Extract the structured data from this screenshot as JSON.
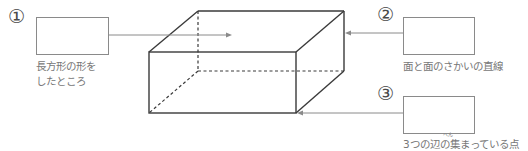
{
  "diagram": {
    "colors": {
      "edge": "#3a3a3a",
      "leader": "#8a8a8a",
      "label_text": "#777777",
      "number": "#4a4a4a"
    },
    "items": [
      {
        "number": "①",
        "label_line1": "長方形の形を",
        "label_line2": "したところ",
        "points_to": "face"
      },
      {
        "number": "②",
        "label": "面と面のさかいの直線",
        "points_to": "edge"
      },
      {
        "number": "③",
        "label_pre": "3つの",
        "label_kanji": "辺",
        "label_ruby": "へん",
        "label_post": "の集まっている点",
        "points_to": "vertex"
      }
    ]
  }
}
